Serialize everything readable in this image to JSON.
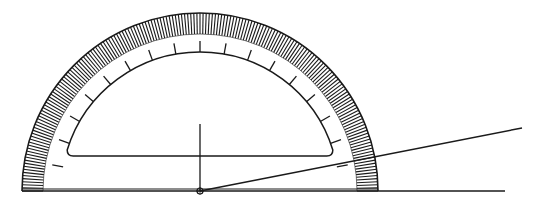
{
  "diagram": {
    "title": "",
    "type": "protractor-measuring-angle",
    "colors": {
      "stroke": "#1a1a1a",
      "background": "#ffffff"
    },
    "center": {
      "x": 200,
      "y": 191
    },
    "outer_radius": 178,
    "scale_inner_radius": 157,
    "tick_arc_radius": 139,
    "fine_divisions": 180,
    "major_tick_step_deg": 10,
    "baseline": {
      "x1": 22,
      "x2": 505,
      "y": 191
    },
    "vertical_line": {
      "x": 200,
      "y1": 124,
      "y2": 191
    },
    "angle_ray": {
      "x1": 200,
      "y1": 191,
      "x2": 522,
      "y2": 128
    },
    "cutout_bottom_y": 156
  }
}
